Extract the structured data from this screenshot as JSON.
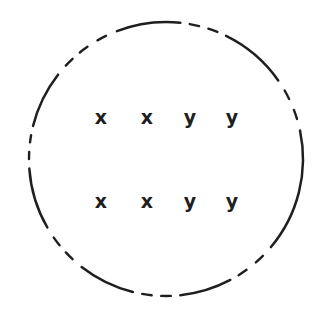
{
  "figure": {
    "background_color": "#ffffff",
    "ink_color": "#1f1f1f",
    "circle": {
      "center_x": 166,
      "center_y": 159,
      "radius": 137,
      "stroke_style": "dashed",
      "stroke_width": 2.5
    },
    "rows": [
      {
        "row_index": 1,
        "baseline_y": 117,
        "labels": [
          {
            "text": "x",
            "x": 101
          },
          {
            "text": "x",
            "x": 147
          },
          {
            "text": "y",
            "x": 190
          },
          {
            "text": "y",
            "x": 232
          }
        ]
      },
      {
        "row_index": 2,
        "baseline_y": 201,
        "labels": [
          {
            "text": "x",
            "x": 101
          },
          {
            "text": "x",
            "x": 147
          },
          {
            "text": "y",
            "x": 190
          },
          {
            "text": "y",
            "x": 232
          }
        ]
      }
    ],
    "arc_segments": [
      {
        "name": "top-long-arc",
        "start_deg": 249,
        "end_deg": 276
      },
      {
        "name": "top-dash-a",
        "start_deg": 280,
        "end_deg": 284
      },
      {
        "name": "top-dash-b",
        "start_deg": 288,
        "end_deg": 292
      },
      {
        "name": "upper-right-long-arc",
        "start_deg": 296,
        "end_deg": 325
      },
      {
        "name": "right-dash-a",
        "start_deg": 330,
        "end_deg": 334
      },
      {
        "name": "right-dash-b",
        "start_deg": 339,
        "end_deg": 343
      },
      {
        "name": "right-long-arc",
        "start_deg": 348,
        "end_deg": 40
      },
      {
        "name": "lower-right-dash-a",
        "start_deg": 45,
        "end_deg": 49
      },
      {
        "name": "lower-right-dash-b",
        "start_deg": 54,
        "end_deg": 58
      },
      {
        "name": "bottom-right-long-arc",
        "start_deg": 62,
        "end_deg": 84
      },
      {
        "name": "bottom-dash-a",
        "start_deg": 88,
        "end_deg": 92
      },
      {
        "name": "bottom-dash-b",
        "start_deg": 96,
        "end_deg": 100
      },
      {
        "name": "bottom-left-long-arc",
        "start_deg": 104,
        "end_deg": 128
      },
      {
        "name": "lower-left-dash-a",
        "start_deg": 133,
        "end_deg": 137
      },
      {
        "name": "lower-left-dash-b",
        "start_deg": 141,
        "end_deg": 145
      },
      {
        "name": "left-long-arc",
        "start_deg": 150,
        "end_deg": 176
      },
      {
        "name": "left-dash-a",
        "start_deg": 180,
        "end_deg": 183
      },
      {
        "name": "left-dash-b",
        "start_deg": 187,
        "end_deg": 190
      },
      {
        "name": "upper-left-long-arc",
        "start_deg": 194,
        "end_deg": 218
      },
      {
        "name": "upper-left-dash-a",
        "start_deg": 223,
        "end_deg": 227
      },
      {
        "name": "upper-left-dash-b",
        "start_deg": 231,
        "end_deg": 235
      },
      {
        "name": "upper-left-dash-c",
        "start_deg": 240,
        "end_deg": 244
      }
    ]
  }
}
